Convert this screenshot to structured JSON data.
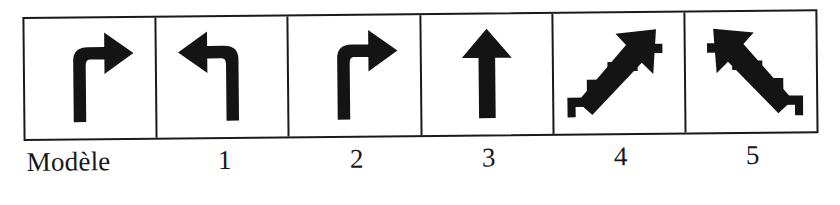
{
  "figure": {
    "kind": "arrow-direction-pictogram-row",
    "panel_count": 6,
    "colors": {
      "background": "#ffffff",
      "ink": "#141414",
      "border": "#1a1a1a"
    },
    "panels": [
      {
        "id": "model",
        "icon": "arrow-up-then-right-icon",
        "description": "Arrow rising vertically then bending to the right"
      },
      {
        "id": "option-1",
        "icon": "arrow-up-then-left-icon",
        "description": "Arrow rising vertically then bending to the left"
      },
      {
        "id": "option-2",
        "icon": "arrow-up-then-right-icon",
        "description": "Arrow rising vertically then bending to the right"
      },
      {
        "id": "option-3",
        "icon": "arrow-straight-up-icon",
        "description": "Straight arrow pointing up"
      },
      {
        "id": "option-4",
        "icon": "arrow-up-stairs-icon",
        "description": "Diagonal arrow pointing up-right over ascending staircase"
      },
      {
        "id": "option-5",
        "icon": "arrow-down-stairs-icon",
        "description": "Diagonal arrow pointing down-right over descending staircase"
      }
    ],
    "captions": [
      {
        "id": "model",
        "label": "Modèle"
      },
      {
        "id": "option-1",
        "label": "1"
      },
      {
        "id": "option-2",
        "label": "2"
      },
      {
        "id": "option-3",
        "label": "3"
      },
      {
        "id": "option-4",
        "label": "4"
      },
      {
        "id": "option-5",
        "label": "5"
      }
    ]
  }
}
